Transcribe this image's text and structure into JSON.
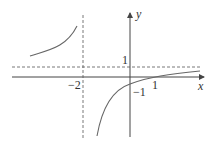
{
  "figure": {
    "type": "function-graph",
    "function": "y = (x - 1)/(x + 2)",
    "axes": {
      "x_label": "x",
      "y_label": "y"
    },
    "tick_labels": {
      "x_neg2": "−2",
      "x_1": "1",
      "y_1": "1",
      "y_neg1": "−1"
    },
    "asymptotes": {
      "vertical": "x = −2",
      "horizontal": "y = 1"
    },
    "colors": {
      "axis": "#444444",
      "curve": "#666666",
      "dashed": "#555555"
    }
  }
}
